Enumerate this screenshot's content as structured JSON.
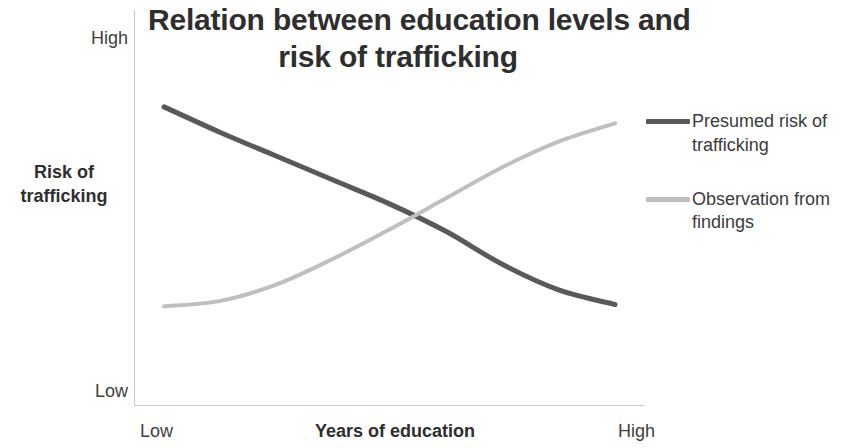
{
  "chart_data": {
    "type": "line",
    "title": "Relation between education levels and risk of trafficking",
    "title_lines": [
      "Relation between education levels and",
      "risk of trafficking"
    ],
    "xlabel": "Years of education",
    "ylabel": "Risk of trafficking",
    "ylabel_lines": [
      "Risk of",
      "trafficking"
    ],
    "x_ticks": [
      "Low",
      "High"
    ],
    "y_ticks": [
      "High",
      "Low"
    ],
    "xlim": [
      "Low",
      "High"
    ],
    "ylim": [
      "Low",
      "High"
    ],
    "grid": false,
    "legend_position": "right",
    "x": [
      0,
      0.125,
      0.25,
      0.375,
      0.5,
      0.625,
      0.75,
      0.875,
      1
    ],
    "series": [
      {
        "name": "Presumed risk of trafficking",
        "color": "#595959",
        "values": [
          0.79,
          0.72,
          0.655,
          0.59,
          0.525,
          0.45,
          0.36,
          0.29,
          0.25
        ]
      },
      {
        "name": "Observation from findings",
        "color": "#bfbfbf",
        "values": [
          0.245,
          0.26,
          0.305,
          0.375,
          0.455,
          0.54,
          0.625,
          0.695,
          0.745
        ]
      }
    ],
    "annotations": []
  },
  "title": {
    "line1": "Relation between education levels and",
    "line2": "risk of trafficking"
  },
  "y_axis": {
    "title_line1": "Risk of",
    "title_line2": "trafficking",
    "tick_high": "High",
    "tick_low": "Low"
  },
  "x_axis": {
    "title": "Years of education",
    "tick_low": "Low",
    "tick_high": "High"
  },
  "legend": {
    "items": [
      {
        "label": "Presumed risk of trafficking",
        "color": "#595959"
      },
      {
        "label": "Observation from findings",
        "color": "#bfbfbf"
      }
    ]
  },
  "colors": {
    "presumed_risk": "#595959",
    "observation": "#bfbfbf",
    "axis": "#c9c9c9",
    "text": "#3b3b3b",
    "background": "#ffffff"
  }
}
